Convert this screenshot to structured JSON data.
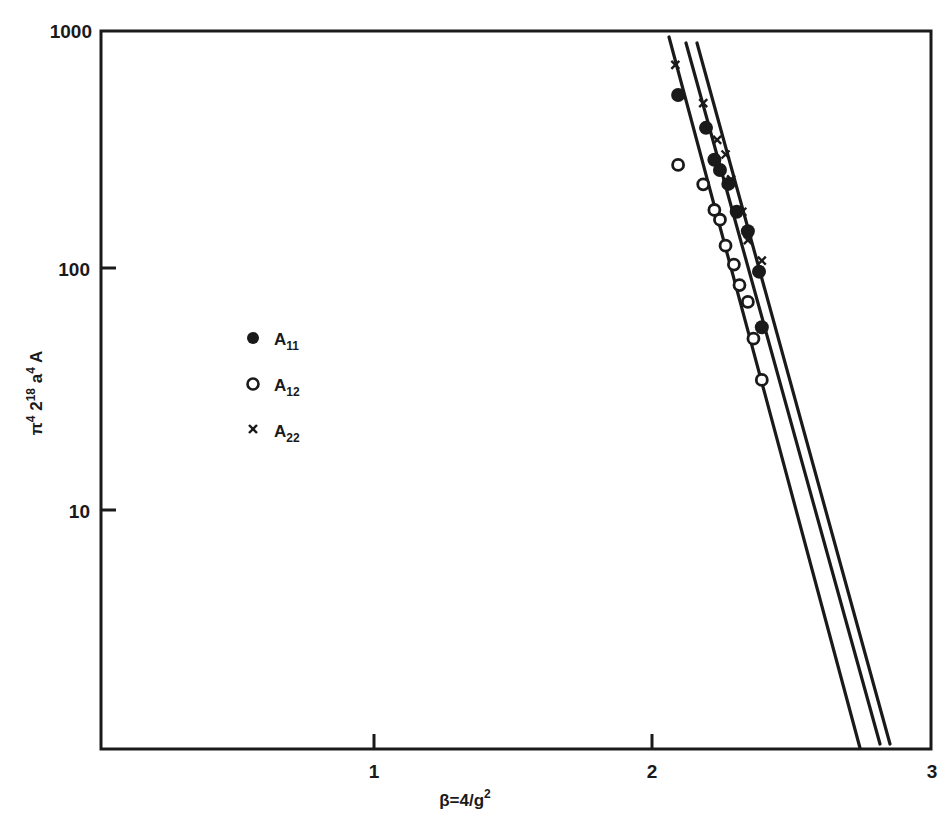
{
  "chart_data": {
    "type": "scatter",
    "title": "",
    "xlabel": "β = 4/g²",
    "ylabel": "π⁴ 2¹⁸ a⁴ A",
    "xlim": [
      0,
      3
    ],
    "ylim": [
      1,
      1000
    ],
    "yscale": "log",
    "grid": false,
    "legend_position": "inside-left",
    "x_ticks": [
      1,
      2,
      3
    ],
    "x_tick_labels": [
      "1",
      "2",
      "3"
    ],
    "y_ticks": [
      10,
      100,
      1000
    ],
    "y_tick_labels": [
      "10",
      "100",
      "1000"
    ],
    "series": [
      {
        "name": "A11",
        "marker": "filled-circle",
        "points": [
          [
            2.09,
            540
          ],
          [
            2.19,
            394
          ],
          [
            2.22,
            290
          ],
          [
            2.24,
            263
          ],
          [
            2.27,
            230
          ],
          [
            2.3,
            176
          ],
          [
            2.34,
            146
          ],
          [
            2.38,
            99
          ],
          [
            2.39,
            58
          ]
        ]
      },
      {
        "name": "A12",
        "marker": "open-circle",
        "points": [
          [
            2.09,
            276
          ],
          [
            2.18,
            229
          ],
          [
            2.22,
            179
          ],
          [
            2.24,
            163
          ],
          [
            2.26,
            127
          ],
          [
            2.29,
            106
          ],
          [
            2.31,
            87
          ],
          [
            2.34,
            74
          ],
          [
            2.36,
            52
          ],
          [
            2.39,
            35
          ]
        ]
      },
      {
        "name": "A22",
        "marker": "cross",
        "points": [
          [
            2.08,
            722
          ],
          [
            2.18,
            500
          ],
          [
            2.23,
            351
          ],
          [
            2.26,
            305
          ],
          [
            2.28,
            240
          ],
          [
            2.32,
            176
          ],
          [
            2.34,
            134
          ],
          [
            2.39,
            110
          ]
        ]
      }
    ],
    "fit_lines": [
      {
        "name": "fit-A12",
        "from": [
          2.06,
          960
        ],
        "to": [
          2.75,
          1
        ]
      },
      {
        "name": "fit-A11",
        "from": [
          2.12,
          900
        ],
        "to": [
          2.82,
          1
        ]
      },
      {
        "name": "fit-A22",
        "from": [
          2.16,
          900
        ],
        "to": [
          2.85,
          1
        ]
      }
    ]
  },
  "axes": {
    "x_label_main": "β=4/g",
    "x_label_sup": "2",
    "y_label_parts": [
      "π",
      "4",
      " 2",
      "18",
      " a",
      "4",
      " A"
    ],
    "x_tick_labels": [
      "1",
      "2",
      "3"
    ],
    "y_tick_labels": [
      "1000",
      "100",
      "10"
    ]
  },
  "legend": {
    "items": [
      {
        "letter": "A",
        "sub": "11",
        "marker": "filled-circle"
      },
      {
        "letter": "A",
        "sub": "12",
        "marker": "open-circle"
      },
      {
        "letter": "A",
        "sub": "22",
        "marker": "cross"
      }
    ]
  },
  "colors": {
    "ink": "#1a1a1a",
    "background": "#ffffff"
  }
}
